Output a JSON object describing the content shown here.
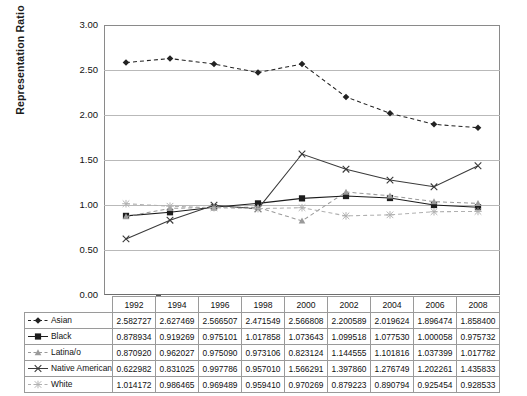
{
  "chart_data": {
    "type": "line",
    "title": "",
    "xlabel": "",
    "ylabel": "Representation Ratio",
    "ylim": [
      0.0,
      3.0
    ],
    "ytick_labels": [
      "3.00",
      "2.50",
      "2.00",
      "1.50",
      "1.00",
      "0.50",
      "0.00"
    ],
    "ytick_values": [
      3.0,
      2.5,
      2.0,
      1.5,
      1.0,
      0.5,
      0.0
    ],
    "grid": true,
    "legend_position": "table-row-headers",
    "categories": [
      "1992",
      "1994",
      "1996",
      "1998",
      "2000",
      "2002",
      "2004",
      "2006",
      "2008"
    ],
    "series": [
      {
        "name": "Asian",
        "marker": "diamond",
        "line_style": "dashed",
        "color": "#222222",
        "values": [
          2.582727,
          2.627469,
          2.566507,
          2.471549,
          2.566808,
          2.200589,
          2.019624,
          1.896474,
          1.8584
        ],
        "labels": [
          "2.582727",
          "2.627469",
          "2.566507",
          "2.471549",
          "2.566808",
          "2.200589",
          "2.019624",
          "1.896474",
          "1.858400"
        ]
      },
      {
        "name": "Black",
        "marker": "square",
        "line_style": "solid",
        "color": "#1c1c1c",
        "values": [
          0.878934,
          0.919269,
          0.975101,
          1.017858,
          1.073643,
          1.099518,
          1.07753,
          1.000058,
          0.975732
        ],
        "labels": [
          "0.878934",
          "0.919269",
          "0.975101",
          "1.017858",
          "1.073643",
          "1.099518",
          "1.077530",
          "1.000058",
          "0.975732"
        ]
      },
      {
        "name": "Latina/o",
        "marker": "triangle",
        "line_style": "dashed",
        "color": "#9a9a9a",
        "values": [
          0.87092,
          0.962027,
          0.97509,
          0.973106,
          0.823124,
          1.144555,
          1.101816,
          1.037399,
          1.017782
        ],
        "labels": [
          "0.870920",
          "0.962027",
          "0.975090",
          "0.973106",
          "0.823124",
          "1.144555",
          "1.101816",
          "1.037399",
          "1.017782"
        ]
      },
      {
        "name": "Native American",
        "marker": "x-cross",
        "line_style": "solid",
        "color": "#3a3a3a",
        "values": [
          0.622982,
          0.831025,
          0.997786,
          0.95701,
          1.566291,
          1.39786,
          1.276749,
          1.202261,
          1.435833
        ],
        "labels": [
          "0.622982",
          "0.831025",
          "0.997786",
          "0.957010",
          "1.566291",
          "1.397860",
          "1.276749",
          "1.202261",
          "1.435833"
        ]
      },
      {
        "name": "White",
        "marker": "asterisk",
        "line_style": "dashed",
        "color": "#b0b0b0",
        "values": [
          1.014172,
          0.986465,
          0.969489,
          0.95941,
          0.970269,
          0.879223,
          0.890794,
          0.925454,
          0.928533
        ],
        "labels": [
          "1.014172",
          "0.986465",
          "0.969489",
          "0.959410",
          "0.970269",
          "0.879223",
          "0.890794",
          "0.925454",
          "0.928533"
        ]
      }
    ]
  },
  "table": {
    "corner_label": "",
    "column_headers": [
      "1992",
      "1994",
      "1996",
      "1998",
      "2000",
      "2002",
      "2004",
      "2006",
      "2008"
    ]
  }
}
